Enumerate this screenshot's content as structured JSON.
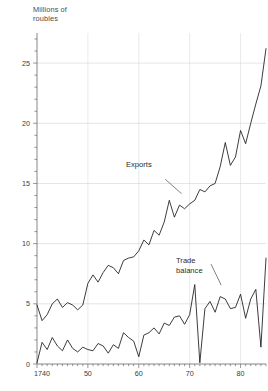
{
  "chart_data": {
    "type": "line",
    "title": "",
    "ylabel": "Millions of\nroubles",
    "xlabel": "",
    "xlim": [
      1740,
      1785
    ],
    "ylim": [
      0,
      27.5
    ],
    "grid": true,
    "legend_position": "inline-annotations",
    "y_ticks": [
      {
        "value": 0,
        "label": "0"
      },
      {
        "value": 5,
        "label": "5"
      },
      {
        "value": 10,
        "label": "10"
      },
      {
        "value": 15,
        "label": "15"
      },
      {
        "value": 20,
        "label": "20"
      },
      {
        "value": 25,
        "label": "25"
      }
    ],
    "y_minor_step": 1,
    "x_ticks": [
      {
        "value": 1740,
        "label": "1740"
      },
      {
        "value": 1750,
        "label": "50"
      },
      {
        "value": 1760,
        "label": "60"
      },
      {
        "value": 1770,
        "label": "70"
      },
      {
        "value": 1780,
        "label": "80"
      }
    ],
    "x_minor_step": 1,
    "annotations": [
      {
        "name": "exports-label",
        "text": "Exports",
        "x": 1762.0,
        "y": 15.6
      },
      {
        "name": "trade-balance-label",
        "text": "Trade\nbalance",
        "x": 1771.5,
        "y": 9.1
      }
    ],
    "series": [
      {
        "name": "Exports",
        "color": "#1a1a1a",
        "x": [
          1740,
          1741,
          1742,
          1743,
          1744,
          1745,
          1746,
          1747,
          1748,
          1749,
          1750,
          1751,
          1752,
          1753,
          1754,
          1755,
          1756,
          1757,
          1758,
          1759,
          1760,
          1761,
          1762,
          1763,
          1764,
          1765,
          1766,
          1767,
          1768,
          1769,
          1770,
          1771,
          1772,
          1773,
          1774,
          1775,
          1776,
          1777,
          1778,
          1779,
          1780,
          1781,
          1782,
          1783,
          1784,
          1785
        ],
        "values": [
          4.9,
          3.6,
          4.1,
          5.0,
          5.4,
          4.7,
          5.1,
          4.9,
          4.5,
          4.9,
          6.7,
          7.4,
          6.8,
          7.6,
          8.2,
          8.0,
          7.5,
          8.6,
          8.8,
          8.9,
          9.4,
          10.3,
          9.9,
          11.1,
          10.7,
          11.8,
          13.6,
          12.2,
          13.2,
          12.9,
          13.3,
          13.6,
          14.5,
          14.3,
          14.8,
          15.0,
          16.4,
          18.4,
          16.5,
          17.2,
          19.4,
          18.3,
          20.0,
          21.6,
          23.1,
          26.2
        ]
      },
      {
        "name": "Trade balance",
        "color": "#1a1a1a",
        "x": [
          1740,
          1741,
          1742,
          1743,
          1744,
          1745,
          1746,
          1747,
          1748,
          1749,
          1750,
          1751,
          1752,
          1753,
          1754,
          1755,
          1756,
          1757,
          1758,
          1759,
          1760,
          1761,
          1762,
          1763,
          1764,
          1765,
          1766,
          1767,
          1768,
          1769,
          1770,
          1771,
          1772,
          1773,
          1774,
          1775,
          1776,
          1777,
          1778,
          1779,
          1780,
          1781,
          1782,
          1783,
          1784,
          1785
        ],
        "values": [
          0.1,
          1.8,
          1.2,
          2.2,
          1.5,
          1.1,
          2.0,
          1.3,
          1.0,
          1.4,
          1.2,
          1.1,
          1.7,
          1.5,
          0.9,
          1.6,
          1.3,
          2.6,
          2.2,
          1.9,
          0.6,
          2.4,
          2.6,
          3.0,
          2.5,
          3.4,
          3.2,
          3.9,
          4.0,
          3.3,
          4.1,
          6.6,
          0.1,
          4.6,
          5.2,
          4.3,
          5.6,
          5.4,
          4.6,
          4.7,
          5.8,
          3.8,
          5.4,
          6.2,
          1.4,
          8.8
        ]
      }
    ]
  }
}
